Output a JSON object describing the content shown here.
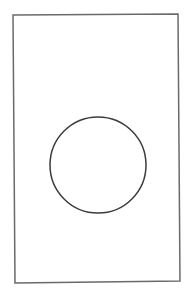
{
  "canvas": {
    "width": 196,
    "height": 307,
    "background": "#ffffff"
  },
  "frame": {
    "points": [
      [
        13,
        15
      ],
      [
        178,
        14
      ],
      [
        180,
        281
      ],
      [
        15,
        283
      ]
    ],
    "stroke": "#6a6a6a",
    "stroke_width": 1.5
  },
  "circle": {
    "cx": 98,
    "cy": 165,
    "r": 48,
    "stroke": "#3c3c3c",
    "stroke_width": 1.5
  }
}
